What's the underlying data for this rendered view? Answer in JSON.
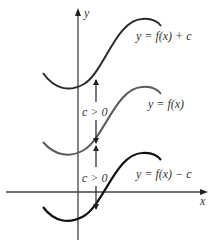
{
  "diagram": {
    "type": "vertical-shift-of-graph",
    "axes": {
      "x_label": "x",
      "y_label": "y"
    },
    "curves": [
      {
        "id": "shift-up",
        "label": "y = f(x) + c",
        "color": "#2b2b2b"
      },
      {
        "id": "original",
        "label": "y = f(x)",
        "color": "#555555"
      },
      {
        "id": "shift-down",
        "label": "y = f(x) − c",
        "color": "#111111"
      }
    ],
    "annotations": [
      {
        "id": "upper-gap",
        "label": "c > 0"
      },
      {
        "id": "lower-gap",
        "label": "c > 0"
      }
    ]
  }
}
